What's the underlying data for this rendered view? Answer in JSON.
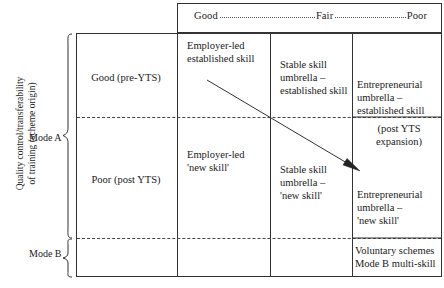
{
  "figure": {
    "type": "matrix-diagram",
    "title": ""
  },
  "header": {
    "col_good": "Good",
    "col_fair": "Fair",
    "col_poor": "Poor",
    "leader_style": "dotted"
  },
  "axis": {
    "y_label_line1": "Quality control/transferability",
    "y_label_line2": "of training (scheme origin)",
    "mode_a": "Mode A",
    "mode_b": "Mode B"
  },
  "rows": {
    "row1_label": "Good (pre-YTS)",
    "row2_label": "Poor (post YTS)"
  },
  "cells": {
    "employer_led_established": "Employer-led\nestablished skill",
    "employer_led_new": "Employer-led\n'new skill'",
    "stable_umbrella_established": "Stable skill\numbrella –\nestablished skill",
    "stable_umbrella_new": "Stable skill\numbrella –\n'new skill'",
    "entrepreneurial_established": "Entrepreneurial\numbrella –\nestablished skill",
    "post_yts_expansion": "(post YTS\nexpansion)",
    "entrepreneurial_new": "Entrepreneurial\numbrella –\n'new skill'",
    "voluntary_schemes": "Voluntary schemes\nMode B multi-skill"
  },
  "arrow": {
    "label": "diagonal trend arrow",
    "from": [
      207,
      80
    ],
    "to": [
      358,
      170
    ],
    "color": "#333333"
  },
  "colors": {
    "line": "#333333",
    "dashed_line": "#444444",
    "text": "#1a1a1a",
    "background": "#ffffff"
  }
}
